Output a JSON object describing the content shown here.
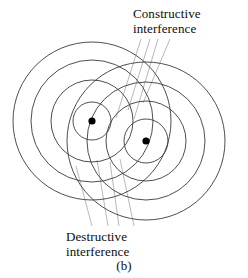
{
  "figure": {
    "caption": "(b)",
    "background_color": "#ffffff",
    "wave_line_color": "#3a3a3a",
    "leader_line_color": "#9a9a9a",
    "source_dot_color": "#000000",
    "annotations": {
      "constructive": {
        "line1": "Constructive",
        "line2": "interference"
      },
      "destructive": {
        "line1": "Destructive",
        "line2": "interference"
      }
    },
    "sources": [
      {
        "name": "left-source",
        "cx": 92,
        "cy": 121,
        "dot_r": 3.6,
        "radii": [
          19,
          41,
          61,
          79
        ]
      },
      {
        "name": "right-source",
        "cx": 146,
        "cy": 141,
        "dot_r": 3.6,
        "radii": [
          22,
          40,
          59,
          79
        ]
      }
    ],
    "constructive_leaders": [
      {
        "x1": 141,
        "y1": 39,
        "x2": 116,
        "y2": 118
      },
      {
        "x1": 150,
        "y1": 39,
        "x2": 128,
        "y2": 110
      },
      {
        "x1": 158,
        "y1": 39,
        "x2": 134,
        "y2": 119
      },
      {
        "x1": 170,
        "y1": 39,
        "x2": 143,
        "y2": 103
      }
    ],
    "destructive_leaders": [
      {
        "x1": 92,
        "y1": 226,
        "x2": 76,
        "y2": 166
      },
      {
        "x1": 108,
        "y1": 226,
        "x2": 97,
        "y2": 160
      },
      {
        "x1": 119,
        "y1": 226,
        "x2": 110,
        "y2": 162
      },
      {
        "x1": 134,
        "y1": 226,
        "x2": 120,
        "y2": 159
      }
    ]
  }
}
